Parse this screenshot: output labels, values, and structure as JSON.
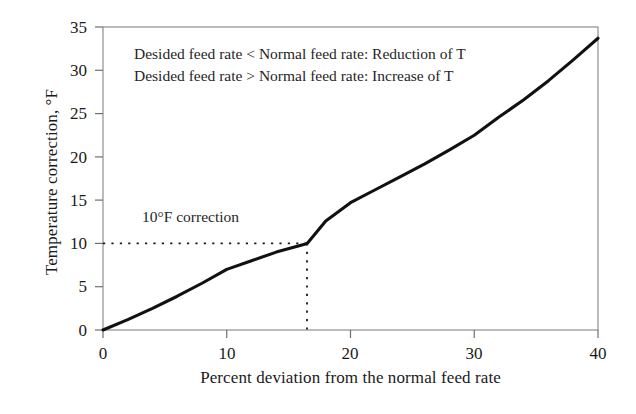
{
  "chart_data": {
    "type": "line",
    "title": "",
    "xlabel": "Percent deviation from the normal feed rate",
    "ylabel": "Temperature correction, °F",
    "xlim": [
      0,
      40
    ],
    "ylim": [
      0,
      35
    ],
    "xticks": [
      "0",
      "10",
      "20",
      "30",
      "40"
    ],
    "yticks": [
      "0",
      "5",
      "10",
      "15",
      "20",
      "25",
      "30",
      "35"
    ],
    "xtick_values": [
      0,
      10,
      20,
      30,
      40
    ],
    "ytick_values": [
      0,
      5,
      10,
      15,
      20,
      25,
      30,
      35
    ],
    "grid": false,
    "legend": false,
    "series": [
      {
        "name": "Temperature correction curve",
        "color": "#111111",
        "x": [
          0,
          2,
          4,
          6,
          8,
          10,
          12,
          14,
          16,
          16.5,
          18,
          20,
          22,
          24,
          26,
          28,
          30,
          32,
          34,
          36,
          38,
          40
        ],
        "y": [
          0.0,
          1.2,
          2.5,
          3.9,
          5.4,
          7.0,
          8.0,
          9.0,
          9.8,
          10.0,
          12.6,
          14.7,
          16.2,
          17.7,
          19.2,
          20.8,
          22.5,
          24.6,
          26.6,
          28.8,
          31.2,
          33.7
        ]
      }
    ],
    "annotations": [
      {
        "name": "note-line-0",
        "text": "Desided feed rate < Normal feed rate: Reduction of T",
        "x": 2.6,
        "y": 32.9
      },
      {
        "name": "note-line-1",
        "text": "Desided feed rate > Normal feed rate: Increase of T",
        "x": 2.6,
        "y": 30.4
      },
      {
        "name": "callout-label",
        "text": "10°F correction",
        "x": 3.2,
        "y": 13.2
      }
    ],
    "guide_lines": [
      {
        "name": "horizontal-10f-guide",
        "style": "dotted",
        "from": [
          0,
          10
        ],
        "to": [
          16.5,
          10
        ]
      },
      {
        "name": "vertical-16-5-guide",
        "style": "dotted",
        "from": [
          16.5,
          10
        ],
        "to": [
          16.5,
          0
        ]
      }
    ],
    "colors": {
      "curve": "#111111",
      "axis": "#8a8a8a",
      "tick": "#6f6f6f",
      "guide": "#1a1a1a",
      "text": "#1a1a1a",
      "background": "#ffffff"
    }
  },
  "axis": {
    "y_title": "Temperature correction, °F",
    "x_title": "Percent deviation from the normal feed rate"
  },
  "ytick_labels": [
    "35",
    "30",
    "25",
    "20",
    "15",
    "10",
    "5",
    "0"
  ],
  "xtick_labels": [
    "0",
    "10",
    "20",
    "30",
    "40"
  ],
  "notes": {
    "line_0": "Desided feed rate < Normal feed rate: Reduction of T",
    "line_1": "Desided feed rate > Normal feed rate: Increase of T",
    "callout": "10°F correction"
  }
}
